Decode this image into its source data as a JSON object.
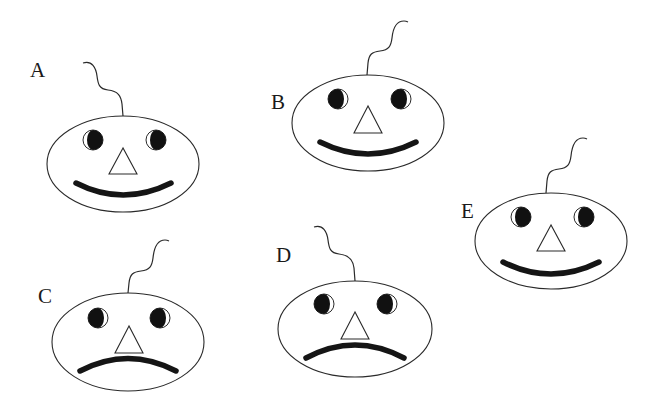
{
  "figure": {
    "colors": {
      "background": "#ffffff",
      "line": "#2a2a2a",
      "fill_dark": "#111111"
    },
    "faces": [
      {
        "label": "A",
        "expression": "smile",
        "pupil_side": "right",
        "stem_direction": "left"
      },
      {
        "label": "B",
        "expression": "smile",
        "pupil_side": "left",
        "stem_direction": "right"
      },
      {
        "label": "C",
        "expression": "frown",
        "pupil_side": "left",
        "stem_direction": "right"
      },
      {
        "label": "D",
        "expression": "frown",
        "pupil_side": "left",
        "stem_direction": "left"
      },
      {
        "label": "E",
        "expression": "smile",
        "pupil_side": "right",
        "stem_direction": "right"
      }
    ]
  }
}
